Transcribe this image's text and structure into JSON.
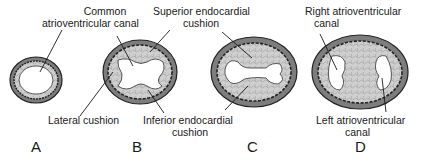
{
  "diagram": {
    "type": "anatomical-cross-section-sequence",
    "panels": [
      {
        "id": "A",
        "label": "A",
        "annotations": [
          "Common atrioventricular canal"
        ]
      },
      {
        "id": "B",
        "label": "B",
        "annotations": [
          "Lateral cushion",
          "Inferior endocardial cushion"
        ]
      },
      {
        "id": "C",
        "label": "C",
        "annotations": [
          "Superior endocardial cushion"
        ]
      },
      {
        "id": "D",
        "label": "D",
        "annotations": [
          "Right atrioventricular canal",
          "Left atrioventricular canal"
        ]
      }
    ],
    "labels": {
      "common_av_line1": "Common",
      "common_av_line2": "atrioventricular canal",
      "superior_line1": "Superior endocardial",
      "superior_line2": "cushion",
      "lateral": "Lateral cushion",
      "inferior_line1": "Inferior endocardial",
      "inferior_line2": "cushion",
      "right_av_line1": "Right atrioventricular",
      "right_av_line2": "canal",
      "left_av_line1": "Left atrioventricular",
      "left_av_line2": "canal"
    },
    "colors": {
      "outer_wall": "#8a8a8a",
      "wall_stroke": "#2a2a2a",
      "cushion_fill": "#c9c9c9",
      "lumen": "#ffffff",
      "line": "#1a1a1a"
    }
  }
}
